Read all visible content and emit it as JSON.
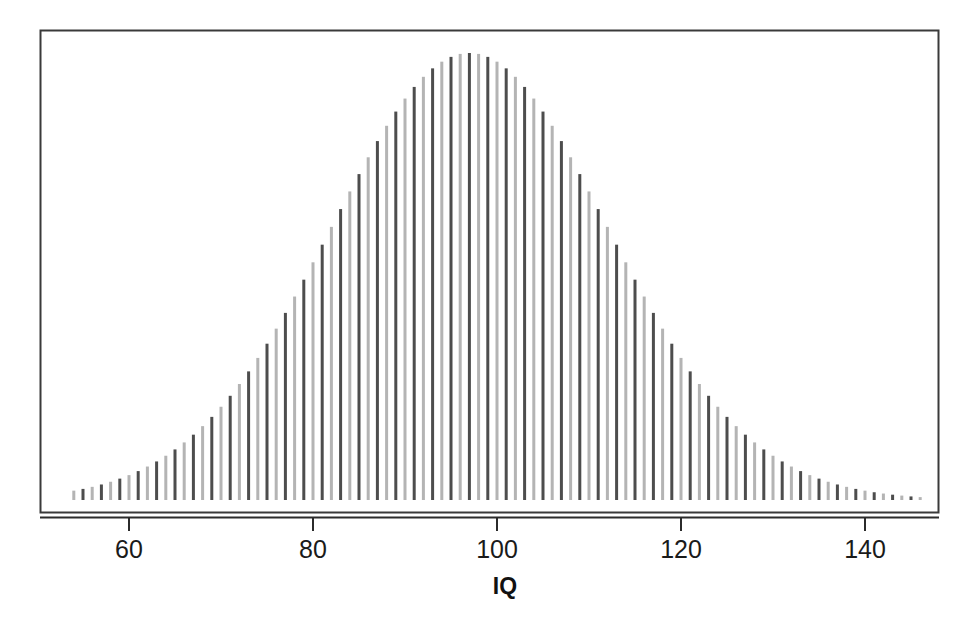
{
  "figure": {
    "background_color": "#ffffff",
    "frame_color": "#3a3a3a",
    "axis_color": "#2b2b2b",
    "title": "",
    "width": 967,
    "height": 629
  },
  "axis": {
    "x_label": "IQ",
    "tick_labels": [
      "60",
      "80",
      "100",
      "120",
      "140"
    ],
    "tick_values": [
      60,
      80,
      100,
      120,
      140
    ]
  },
  "chart_data": {
    "type": "bar",
    "title": "",
    "subtitle": "",
    "xlabel": "IQ",
    "ylabel": "",
    "xlim": [
      52.3,
      147.7
    ],
    "ylim": [
      0,
      0.0275
    ],
    "grid": false,
    "legend": null,
    "legend_position": "none",
    "distribution": {
      "mean": 100,
      "sd": 15,
      "shape": "normal"
    },
    "bar_style": {
      "width_px": 3,
      "light_color": "#b4b4b4",
      "dark_color": "#4d4d4d",
      "alternation": "alternating-light-dark"
    },
    "categories": [
      54,
      55,
      56,
      57,
      58,
      59,
      60,
      61,
      62,
      63,
      64,
      65,
      66,
      67,
      68,
      69,
      70,
      71,
      72,
      73,
      74,
      75,
      76,
      77,
      78,
      79,
      80,
      81,
      82,
      83,
      84,
      85,
      86,
      87,
      88,
      89,
      90,
      91,
      92,
      93,
      94,
      95,
      96,
      97,
      98,
      99,
      100,
      101,
      102,
      103,
      104,
      105,
      106,
      107,
      108,
      109,
      110,
      111,
      112,
      113,
      114,
      115,
      116,
      117,
      118,
      119,
      120,
      121,
      122,
      123,
      124,
      125,
      126,
      127,
      128,
      129,
      130,
      131,
      132,
      133,
      134,
      135,
      136,
      137,
      138,
      139,
      140,
      141,
      142,
      143,
      144,
      145,
      146
    ],
    "values": [
      0.00123,
      0.00146,
      0.00173,
      0.00204,
      0.0024,
      0.00281,
      0.00327,
      0.0038,
      0.0044,
      0.00507,
      0.00582,
      0.00665,
      0.00757,
      0.00859,
      0.00971,
      0.01093,
      0.01226,
      0.0137,
      0.01525,
      0.01691,
      0.01868,
      0.02055,
      0.02253,
      0.0246,
      0.02675,
      0.02897,
      0.03125,
      0.03357,
      0.03591,
      0.03825,
      0.04057,
      0.04285,
      0.04506,
      0.04719,
      0.0492,
      0.05107,
      0.05278,
      0.05431,
      0.05564,
      0.05675,
      0.05763,
      0.05826,
      0.05865,
      0.05877,
      0.05865,
      0.05826,
      0.05763,
      0.05675,
      0.05564,
      0.05431,
      0.05278,
      0.05107,
      0.0492,
      0.04719,
      0.04506,
      0.04285,
      0.04057,
      0.03825,
      0.03591,
      0.03357,
      0.03125,
      0.02897,
      0.02675,
      0.0246,
      0.02253,
      0.02055,
      0.01868,
      0.01691,
      0.01525,
      0.0137,
      0.01226,
      0.01093,
      0.00971,
      0.00859,
      0.00757,
      0.00665,
      0.00582,
      0.00507,
      0.0044,
      0.0038,
      0.00327,
      0.00281,
      0.0024,
      0.00204,
      0.00173,
      0.00146,
      0.00123,
      0.00102,
      0.00085,
      0.0007,
      0.00058,
      0.00047,
      0.00038
    ]
  }
}
